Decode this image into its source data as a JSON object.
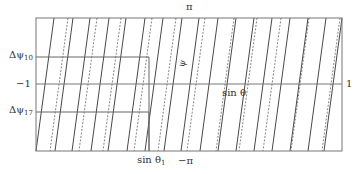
{
  "diagram": {
    "frame": {
      "x1": 36,
      "y1": 18,
      "x2": 342,
      "y2": 151,
      "stroke": "#777777"
    },
    "minus_one_line_y": 84,
    "boxes": [
      {
        "name": "box-delta-psi-10",
        "y": 57,
        "x_end": 149
      },
      {
        "name": "box-delta-psi-17",
        "y": 112,
        "x_end": 149
      }
    ],
    "slant_shift": 18,
    "solid_lines_top_x": [
      54,
      73,
      90,
      109,
      126,
      145,
      163,
      182,
      199,
      218,
      236,
      254,
      272,
      290,
      308,
      326,
      342
    ],
    "dashed_lines_top_x": [
      68,
      97,
      121,
      152,
      176,
      205,
      234,
      257,
      281,
      309,
      340
    ],
    "line_color": "#333333",
    "dashed_color": "#666666"
  },
  "labels": {
    "top_pi": "π",
    "bottom_minus_pi": "−π",
    "left_minus_one": "−1",
    "right_one": "1",
    "delta_psi_10": "Δψ",
    "delta_psi_10_sub": "10",
    "delta_psi_17": "Δψ",
    "delta_psi_17_sub": "17",
    "psi": "ψ",
    "sin_theta": "sin θ",
    "sin_theta_1": "sin θ",
    "sin_theta_1_sub": "1"
  }
}
